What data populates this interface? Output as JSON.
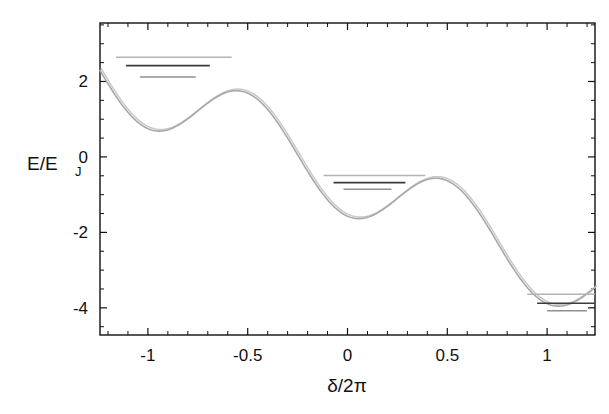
{
  "figure": {
    "background": "#ffffff",
    "frame_color": "#111111"
  },
  "axes": {
    "x_label": "δ/2π",
    "y_label_main": "E/E",
    "y_label_sub": "J",
    "x_ticks": [
      "-1",
      "-0.5",
      "0",
      "0.5",
      "1"
    ],
    "x_tick_values": [
      -1,
      -0.5,
      0,
      0.5,
      1
    ],
    "y_ticks": [
      "2",
      "0",
      "-2",
      "-4"
    ],
    "y_tick_values": [
      2,
      0,
      -2,
      -4
    ],
    "x_minor_step": 0.1,
    "y_minor_step": 0.5
  },
  "chart_data": {
    "type": "line",
    "title": "",
    "xlabel": "δ/2π",
    "ylabel": "E/E_J",
    "xlim": [
      -1.24,
      1.24
    ],
    "ylim": [
      -4.72,
      3.55
    ],
    "grid": false,
    "legend": "none",
    "potential": {
      "name": "washboard potential",
      "color": "#a8a8a8",
      "formula": "U(x) = -1.05*cos(2*pi*x) - 2.32*x - 0.52",
      "amplitude": 1.05,
      "tilt_slope": -2.32,
      "offset": -0.52,
      "period": 1.0,
      "x": [
        -1.24,
        -1.15,
        -1.05,
        -0.95,
        -0.85,
        -0.75,
        -0.65,
        -0.55,
        -0.45,
        -0.35,
        -0.25,
        -0.15,
        -0.05,
        0.05,
        0.15,
        0.25,
        0.35,
        0.45,
        0.55,
        0.65,
        0.75,
        0.85,
        0.95,
        1.05,
        1.15,
        1.24
      ],
      "y": [
        3.4,
        2.95,
        2.37,
        2.05,
        2.0,
        2.2,
        2.54,
        2.75,
        2.66,
        2.27,
        1.68,
        1.02,
        0.4,
        -0.1,
        -0.46,
        -0.63,
        -0.64,
        -0.54,
        -0.48,
        -0.59,
        -0.94,
        -1.5,
        -2.2,
        -2.95,
        -3.65,
        -4.05
      ]
    },
    "wells": [
      {
        "name": "well-left",
        "center_x": -0.9,
        "minimum_energy": 1.98,
        "barrier_energy": 2.75,
        "levels": [
          {
            "index": 0,
            "energy": 2.12,
            "x_start": -1.04,
            "x_end": -0.76,
            "color": "#8f8f8f"
          },
          {
            "index": 1,
            "energy": 2.42,
            "x_start": -1.11,
            "x_end": -0.69,
            "color": "#3b3b3b"
          },
          {
            "index": 2,
            "energy": 2.64,
            "x_start": -1.16,
            "x_end": -0.58,
            "color": "#b4b4b4"
          }
        ]
      },
      {
        "name": "well-middle",
        "center_x": 0.1,
        "minimum_energy": -0.98,
        "barrier_energy": -0.34,
        "levels": [
          {
            "index": 0,
            "energy": -0.86,
            "x_start": -0.02,
            "x_end": 0.22,
            "color": "#8f8f8f"
          },
          {
            "index": 1,
            "energy": -0.68,
            "x_start": -0.07,
            "x_end": 0.29,
            "color": "#3b3b3b"
          },
          {
            "index": 2,
            "energy": -0.49,
            "x_start": -0.12,
            "x_end": 0.39,
            "color": "#b4b4b4"
          }
        ]
      },
      {
        "name": "well-right",
        "center_x": 1.08,
        "minimum_energy": -4.22,
        "barrier_energy": -3.3,
        "levels": [
          {
            "index": 0,
            "energy": -4.08,
            "x_start": 1.0,
            "x_end": 1.2,
            "color": "#8f8f8f"
          },
          {
            "index": 1,
            "energy": -3.88,
            "x_start": 0.95,
            "x_end": 1.24,
            "color": "#3b3b3b"
          },
          {
            "index": 2,
            "energy": -3.64,
            "x_start": 0.9,
            "x_end": 1.24,
            "color": "#b4b4b4"
          }
        ]
      }
    ]
  }
}
